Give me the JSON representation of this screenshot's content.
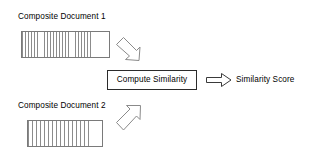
{
  "diagram": {
    "title_doc1": "Composite Document 1",
    "title_doc2": "Composite Document 2",
    "process_label": "Compute Similarity",
    "result_label": "Similarity Score",
    "icons": {
      "arrow_down_right": "arrow-down-right-icon",
      "arrow_up_right": "arrow-up-right-icon",
      "arrow_right": "arrow-right-icon"
    },
    "colors": {
      "background": "#ffffff",
      "text": "#000000",
      "box_border": "#2b2b2b",
      "bar_border": "#7a7a7a",
      "stripe": "#8c8c8c",
      "arrow_stroke": "#8a8a8a"
    },
    "documents": [
      {
        "name": "doc1",
        "title": "Composite Document 1",
        "stripe_fill_fraction": 0.79,
        "stripe_count": 23
      },
      {
        "name": "doc2",
        "title": "Composite Document 2",
        "stripe_fill_fraction": 0.8,
        "stripe_count": 15
      }
    ]
  }
}
